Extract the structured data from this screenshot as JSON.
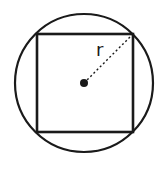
{
  "diagram": {
    "colors": {
      "stroke": "#1a1a1a",
      "background": "#ffffff"
    },
    "circle": {
      "cx": 84,
      "cy": 83,
      "r": 69
    },
    "square": {
      "x": 37,
      "y": 34,
      "width": 96,
      "height": 98
    },
    "center_point": {
      "cx": 84,
      "cy": 83,
      "r": 4
    },
    "radius_line": {
      "x1": 84,
      "y1": 83,
      "x2": 133,
      "y2": 34,
      "style": "dotted"
    },
    "radius_label": {
      "text": "r",
      "x": 96,
      "y": 56
    }
  }
}
